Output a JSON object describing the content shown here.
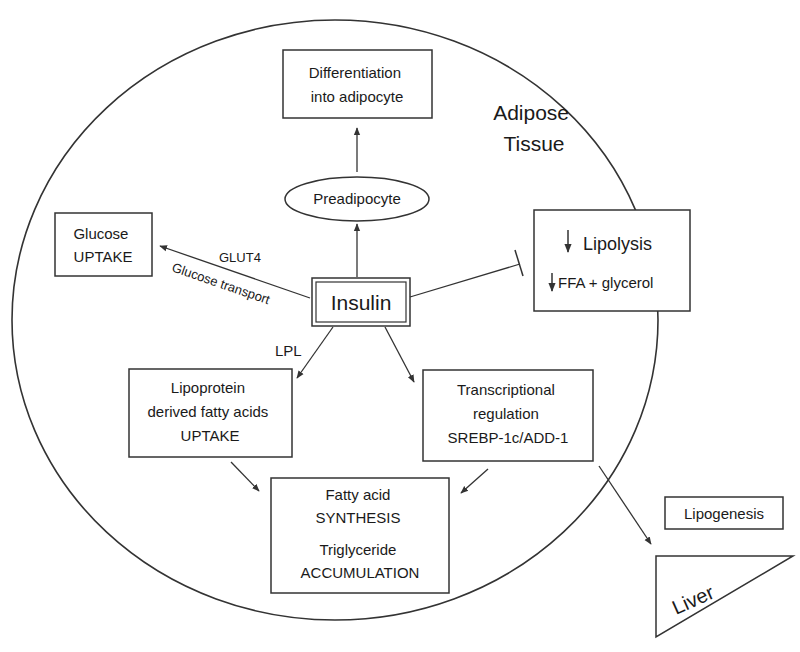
{
  "diagram": {
    "region_label": {
      "line1": "Adipose",
      "line2": "Tissue"
    },
    "nodes": {
      "differentiation": {
        "line1": "Differentiation",
        "line2": "into adipocyte"
      },
      "preadipocyte": {
        "label": "Preadipocyte"
      },
      "glucose_uptake": {
        "line1": "Glucose",
        "line2": "UPTAKE"
      },
      "insulin": {
        "label": "Insulin"
      },
      "lipolysis": {
        "line1": "Lipolysis",
        "line2": "FFA + glycerol",
        "arrow_glyph": "↓"
      },
      "lipoprotein": {
        "line1": "Lipoprotein",
        "line2": "derived fatty acids",
        "line3": "UPTAKE"
      },
      "transcriptional": {
        "line1": "Transcriptional",
        "line2": "regulation",
        "line3": "SREBP-1c/ADD-1"
      },
      "fatty_acid": {
        "line1": "Fatty acid",
        "line2": "SYNTHESIS",
        "line3": "Triglyceride",
        "line4": "ACCUMULATION"
      },
      "lipogenesis": {
        "label": "Lipogenesis"
      },
      "liver": {
        "label": "Liver"
      }
    },
    "edge_labels": {
      "glut4": "GLUT4",
      "glucose_transport": "Glucose transport",
      "lpl": "LPL"
    },
    "edges": [
      {
        "from": "insulin",
        "to": "preadipocyte",
        "type": "arrow"
      },
      {
        "from": "preadipocyte",
        "to": "differentiation",
        "type": "arrow"
      },
      {
        "from": "insulin",
        "to": "glucose_uptake",
        "type": "arrow",
        "label": "GLUT4 / Glucose transport"
      },
      {
        "from": "insulin",
        "to": "lipolysis",
        "type": "inhibition"
      },
      {
        "from": "insulin",
        "to": "lipoprotein",
        "type": "arrow",
        "label": "LPL"
      },
      {
        "from": "insulin",
        "to": "transcriptional",
        "type": "arrow"
      },
      {
        "from": "lipoprotein",
        "to": "fatty_acid",
        "type": "arrow"
      },
      {
        "from": "transcriptional",
        "to": "fatty_acid",
        "type": "arrow"
      },
      {
        "from": "transcriptional",
        "to": "liver",
        "type": "arrow"
      }
    ],
    "colors": {
      "stroke": "#333333",
      "text": "#1a1a1a",
      "background": "#ffffff"
    }
  }
}
